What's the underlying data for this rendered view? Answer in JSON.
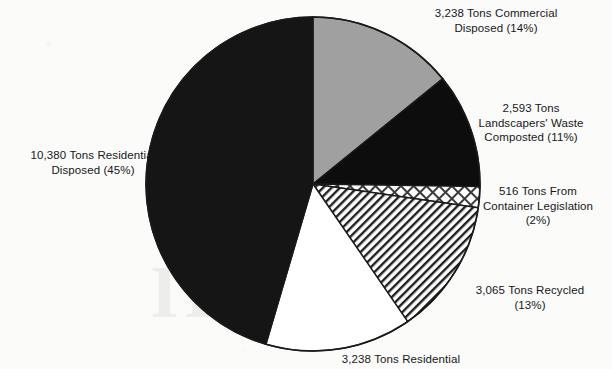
{
  "chart_data": {
    "type": "pie",
    "title": "",
    "subtitle": "",
    "xlabel": "",
    "ylabel": "",
    "legend_position": "none",
    "grid": false,
    "units": "Tons",
    "total_tons": 23030,
    "categories": [
      "Commercial Disposed",
      "Landscapers' Waste Composted",
      "From Container Legislation",
      "Recycled",
      "Residential Composted",
      "Residential Disposed"
    ],
    "values": [
      3238,
      2593,
      516,
      3065,
      3238,
      10380
    ],
    "percentages": [
      14,
      11,
      2,
      13,
      14,
      45
    ],
    "slices": [
      {
        "name": "commercial-disposed",
        "tons": "3,238",
        "percent": "14%",
        "value": 3238,
        "pct": 14,
        "fill": "#a0a0a0",
        "pattern": "solid-gray",
        "label_text": "3,238 Tons Commercial\nDisposed (14%)"
      },
      {
        "name": "landscapers-waste-composted",
        "tons": "2,593",
        "percent": "11%",
        "value": 2593,
        "pct": 11,
        "fill": "#0d0d0d",
        "pattern": "solid-black",
        "label_text": "2,593 Tons\nLandscapers' Waste\nComposted (11%)"
      },
      {
        "name": "container-legislation",
        "tons": "516",
        "percent": "2%",
        "value": 516,
        "pct": 2,
        "fill": "#ffffff",
        "pattern": "crosshatch",
        "label_text": "516 Tons From\nContainer Legislation\n(2%)"
      },
      {
        "name": "recycled",
        "tons": "3,065",
        "percent": "13%",
        "value": 3065,
        "pct": 13,
        "fill": "#ffffff",
        "pattern": "diagonal-hatch",
        "label_text": "3,065 Tons Recycled\n(13%)"
      },
      {
        "name": "residential-composted",
        "tons": "3,238",
        "percent": "14%",
        "value": 3238,
        "pct": 14,
        "fill": "#ffffff",
        "pattern": "solid-white",
        "label_text": "3,238 Tons Residential"
      },
      {
        "name": "residential-disposed",
        "tons": "10,380",
        "percent": "45%",
        "value": 10380,
        "pct": 45,
        "fill": "#151515",
        "pattern": "solid-dark",
        "label_text": "10,380 Tons Residential\nDisposed (45%)"
      }
    ],
    "geometry": {
      "center_x": 313,
      "center_y": 184,
      "radius": 167,
      "start_angle_deg": 0,
      "direction": "clockwise"
    },
    "colors": {
      "background": "#fbfbf9",
      "outline": "#1a1a1a",
      "gray_slice": "#a0a0a0",
      "black_slice": "#0d0d0d",
      "dark_slice": "#151515",
      "white_slice": "#ffffff",
      "text": "#16181a"
    }
  },
  "background": {
    "watermark_text": "ID"
  }
}
